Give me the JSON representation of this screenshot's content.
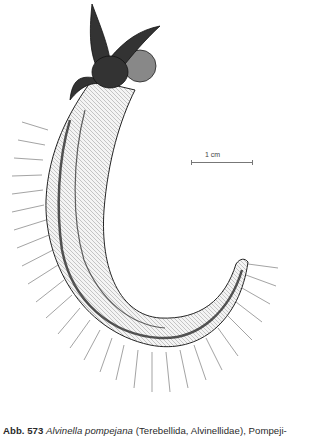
{
  "figure": {
    "scale_bar": {
      "label": "1 cm"
    }
  },
  "caption": {
    "label": "Abb. 573",
    "species": "Alvinella pompejana",
    "rest": "(Terebellida, Alvinellidae), Pompeji-"
  },
  "colors": {
    "ink": "#1a1a1a",
    "background": "#ffffff"
  }
}
